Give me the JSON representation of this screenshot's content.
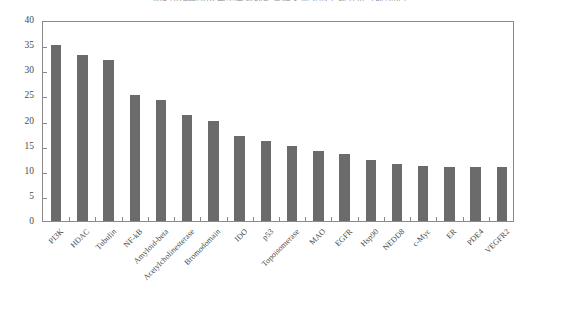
{
  "chart_data": {
    "type": "bar",
    "title_visible_fragment": "图4  2014—2018 年中国新药靶点相关研究的主题分布（前20位）",
    "xlabel": "",
    "ylabel": "",
    "ylim": [
      0,
      40
    ],
    "yticks": [
      0,
      5,
      10,
      15,
      20,
      25,
      30,
      35,
      40
    ],
    "ytick_labels": [
      "0",
      "5",
      "10",
      "15",
      "20",
      "25",
      "30",
      "35",
      "40"
    ],
    "grid": false,
    "legend": null,
    "orientation": "vertical",
    "bar_color": "#6b6b6b",
    "frame_color": "#8a8a8a",
    "categories": [
      "PI3K",
      "HDAC",
      "Tubulin",
      "NF-kB",
      "Amyloid-beta",
      "Acetylcholinesterase",
      "Bromodomain",
      "IDO",
      "p53",
      "Topoisomerase",
      "MAO",
      "EGFR",
      "Hsp90",
      "NEDD8",
      "c-Myc",
      "ER",
      "PDE4",
      "VEGFR2"
    ],
    "values": [
      35,
      33,
      32,
      25,
      24,
      21,
      20,
      17,
      16,
      15,
      14,
      13.3,
      12.2,
      11.4,
      11,
      10.7,
      10.7,
      10.7
    ]
  },
  "axes": {
    "y_axis_name": "count-axis",
    "x_axis_name": "target-category-axis"
  }
}
